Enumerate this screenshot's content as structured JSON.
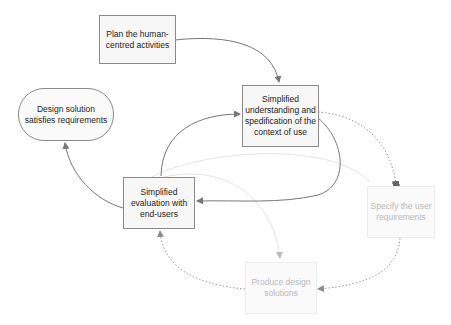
{
  "diagram": {
    "nodes": [
      {
        "id": "plan",
        "label": "Plan the human-centred activities",
        "lines": [
          "Plan the human-",
          "centred activities"
        ],
        "style": "active"
      },
      {
        "id": "understand",
        "label": "Simplified understanding and spedification of the context of use",
        "lines": [
          "Simplified",
          "understanding",
          "and spedification",
          "of the context of",
          "use"
        ],
        "style": "active"
      },
      {
        "id": "solution",
        "label": "Design solution satisfies requirements",
        "lines": [
          "Design solution satisfies",
          "requirements"
        ],
        "style": "terminal"
      },
      {
        "id": "evaluate",
        "label": "Simplified evaluation with end-users",
        "lines": [
          "Simplified",
          "evaluation with",
          "end-users"
        ],
        "style": "active"
      },
      {
        "id": "specify",
        "label": "Specify the user requirements",
        "lines": [
          "Specify the user",
          "requirements"
        ],
        "style": "faded"
      },
      {
        "id": "produce",
        "label": "Produce design solutions",
        "lines": [
          "Produce design",
          "solutions"
        ],
        "style": "faded"
      }
    ],
    "edges": [
      {
        "from": "plan",
        "to": "understand",
        "style": "solid"
      },
      {
        "from": "understand",
        "to": "evaluate",
        "style": "solid"
      },
      {
        "from": "evaluate",
        "to": "understand",
        "style": "solid"
      },
      {
        "from": "evaluate",
        "to": "solution",
        "style": "solid"
      },
      {
        "from": "understand",
        "to": "specify",
        "style": "dotted"
      },
      {
        "from": "specify",
        "to": "produce",
        "style": "dotted"
      },
      {
        "from": "produce",
        "to": "evaluate",
        "style": "dotted"
      },
      {
        "from": "evaluate",
        "to": "specify",
        "style": "faint"
      },
      {
        "from": "evaluate",
        "to": "produce",
        "style": "faint"
      }
    ],
    "colors": {
      "active_border": "#8a8a8a",
      "active_fill": "#f7f7f7",
      "faded_border": "#ececec",
      "faded_text": "#b9b9b9",
      "edge_solid": "#777777",
      "edge_dotted": "#999999",
      "edge_faint": "#e2e2e2"
    }
  }
}
